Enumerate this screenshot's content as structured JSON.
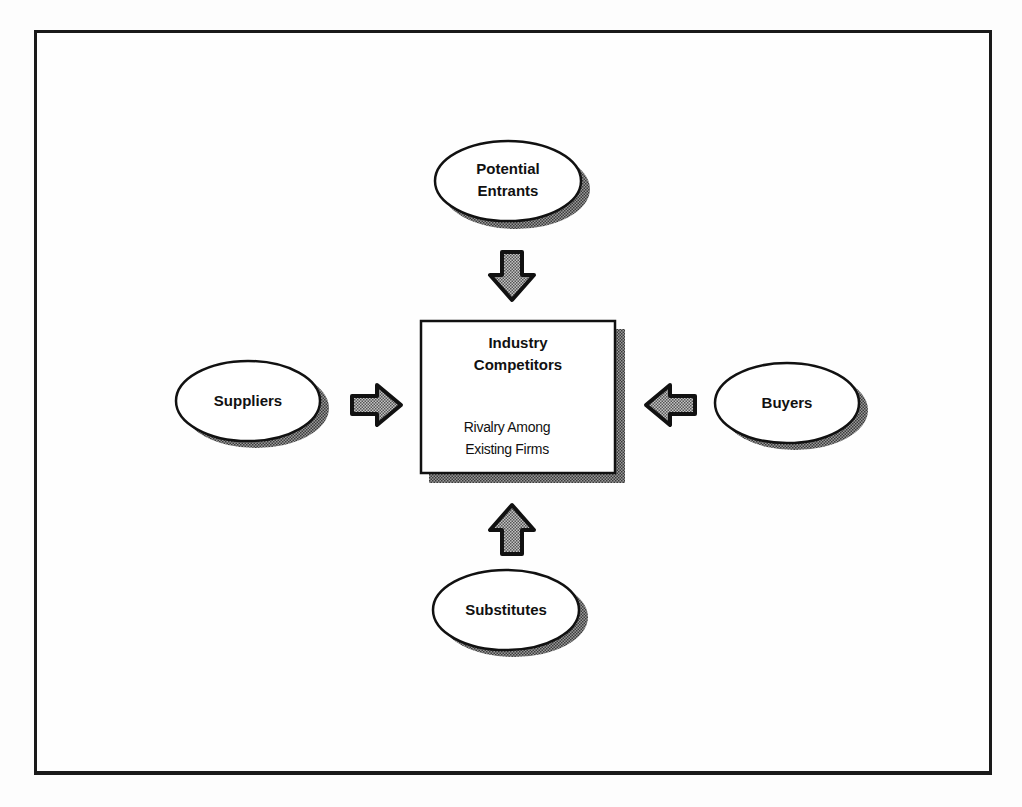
{
  "diagram": {
    "type": "five-forces",
    "center": {
      "title_line1": "Industry",
      "title_line2": "Competitors",
      "subtitle_line1": "Rivalry Among",
      "subtitle_line2": "Existing Firms"
    },
    "forces": {
      "top": {
        "line1": "Potential",
        "line2": "Entrants",
        "arrow_direction": "down"
      },
      "left": {
        "label": "Suppliers",
        "arrow_direction": "right"
      },
      "right": {
        "label": "Buyers",
        "arrow_direction": "left"
      },
      "bottom": {
        "label": "Substitutes",
        "arrow_direction": "up"
      }
    },
    "colors": {
      "stroke": "#111111",
      "fill": "#ffffff",
      "shadow": "#555555"
    }
  }
}
